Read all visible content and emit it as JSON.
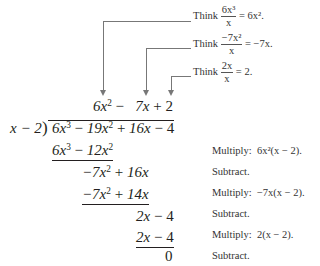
{
  "quotient": {
    "t1": "6x",
    "t1_exp": "2",
    "op1": "−",
    "t2": "7x",
    "op2": "+",
    "t3": "2"
  },
  "divisor": "x − 2",
  "dividend": {
    "a": "6x",
    "a_exp": "3",
    "op1": "−",
    "b": "19x",
    "b_exp": "2",
    "op2": "+",
    "c": "16x",
    "op3": "−",
    "d": "4"
  },
  "steps": [
    {
      "expr_a": "6x",
      "expr_a_exp": "3",
      "op": "−",
      "expr_b": "12x",
      "expr_b_exp": "2",
      "note_label": "Multiply:",
      "note_expr": "6x²(x − 2)."
    },
    {
      "expr_a": "−7x",
      "expr_a_exp": "2",
      "op": "+",
      "expr_b": "16x",
      "note_label": "Subtract."
    },
    {
      "expr_a": "−7x",
      "expr_a_exp": "2",
      "op": "+",
      "expr_b": "14x",
      "note_label": "Multiply:",
      "note_expr": "−7x(x − 2)."
    },
    {
      "expr_a": "2x",
      "op": "−",
      "expr_b": "4",
      "note_label": "Subtract."
    },
    {
      "expr_a": "2x",
      "op": "−",
      "expr_b": "4",
      "note_label": "Multiply:",
      "note_expr": "2(x − 2)."
    },
    {
      "expr_a": "0",
      "note_label": "Subtract."
    }
  ],
  "think_notes": [
    {
      "label": "Think",
      "num": "6x³",
      "den": "x",
      "result": "= 6x²."
    },
    {
      "label": "Think",
      "num": "−7x²",
      "den": "x",
      "result": "= −7x."
    },
    {
      "label": "Think",
      "num": "2x",
      "den": "x",
      "result": "= 2."
    }
  ],
  "colors": {
    "text": "#231f20",
    "arrow": "#777777",
    "note": "#333333"
  }
}
